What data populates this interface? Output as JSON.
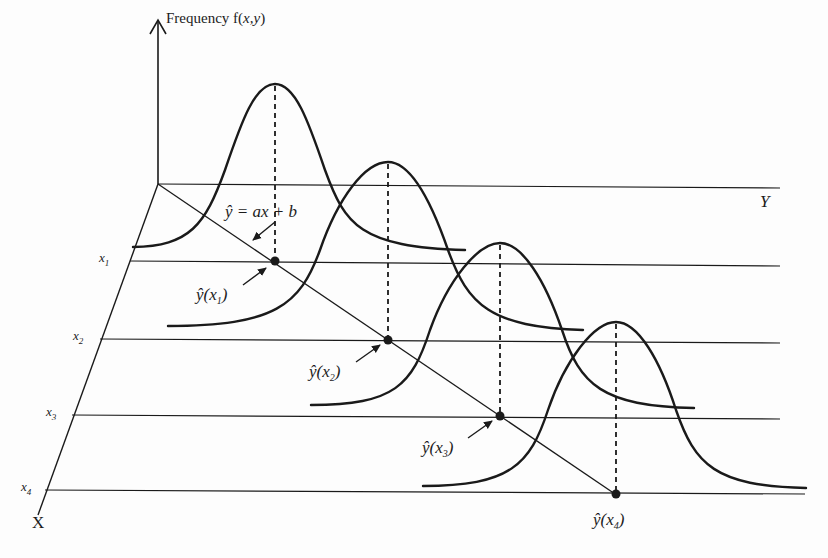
{
  "diagram": {
    "z_axis_label": "Frequency f(x,y)",
    "x_axis_label": "X",
    "y_axis_label": "Y",
    "x_ticks": [
      "x1",
      "x2",
      "x3",
      "x4"
    ],
    "regression_label": "ŷ = ax + b",
    "predicted_labels": [
      "ŷ(x1)",
      "ŷ(x2)",
      "ŷ(x3)",
      "ŷ(x4)"
    ],
    "colors": {
      "line": "#1a1a1a",
      "background": "#ffffff"
    }
  },
  "labels": {
    "freq_prefix": "Frequency f(",
    "freq_args": "x,y",
    "freq_suffix": ")",
    "X": "X",
    "Y": "Y",
    "x1": "x",
    "x1_sub": "1",
    "x2": "x",
    "x2_sub": "2",
    "x3": "x",
    "x3_sub": "3",
    "x4": "x",
    "x4_sub": "4",
    "reg": "ŷ = ax + b",
    "yhat1": "ŷ(x",
    "yhat1_sub": "1",
    "yhat2": "ŷ(x",
    "yhat2_sub": "2",
    "yhat3": "ŷ(x",
    "yhat3_sub": "3",
    "yhat4": "ŷ(x",
    "yhat4_sub": "4",
    "close": ")"
  }
}
